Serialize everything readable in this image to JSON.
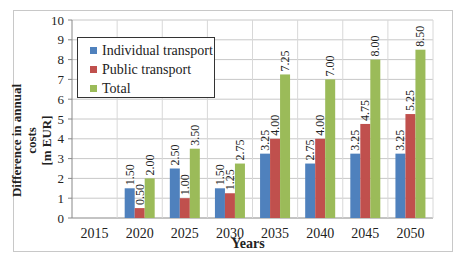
{
  "chart_data": {
    "type": "bar",
    "title": "",
    "xlabel": "Years",
    "ylabel": "Difference in annual costs [m EUR]",
    "ylabel_lines": [
      "Difference in annual costs",
      "[m EUR]"
    ],
    "ylim": [
      0,
      10
    ],
    "yticks": [
      "0",
      "1",
      "2",
      "3",
      "4",
      "5",
      "6",
      "7",
      "8",
      "9",
      "10"
    ],
    "grid": true,
    "legend_position": "upper-left-inside",
    "categories": [
      "2015",
      "2020",
      "2025",
      "2030",
      "2035",
      "2040",
      "2045",
      "2050"
    ],
    "series": [
      {
        "name": "Individual transport",
        "color": "#4f81bd",
        "values": [
          null,
          1.5,
          2.5,
          1.5,
          3.25,
          2.75,
          3.25,
          3.25
        ],
        "labels": [
          "",
          "1.50",
          "2.50",
          "1.50",
          "3.25",
          "2.75",
          "3.25",
          "3.25"
        ]
      },
      {
        "name": "Public transport",
        "color": "#c0504d",
        "values": [
          null,
          0.5,
          1.0,
          1.25,
          4.0,
          4.0,
          4.75,
          5.25
        ],
        "labels": [
          "",
          "0.50",
          "1.00",
          "1.25",
          "4.00",
          "4.00",
          "4.75",
          "5.25"
        ]
      },
      {
        "name": "Total",
        "color": "#9bbb59",
        "values": [
          null,
          2.0,
          3.5,
          2.75,
          7.25,
          7.0,
          8.0,
          8.5
        ],
        "labels": [
          "",
          "2.00",
          "3.50",
          "2.75",
          "7.25",
          "7.00",
          "8.00",
          "8.50"
        ]
      }
    ]
  },
  "legend": {
    "items": [
      {
        "label": "Individual transport",
        "color": "#4f81bd"
      },
      {
        "label": "Public transport",
        "color": "#c0504d"
      },
      {
        "label": "Total",
        "color": "#9bbb59"
      }
    ]
  },
  "axes": {
    "x_title": "Years",
    "y_title_line1": "Difference in annual costs",
    "y_title_line2": "[m EUR]"
  }
}
